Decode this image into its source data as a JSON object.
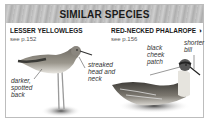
{
  "panel": {
    "title": "SIMILAR SPECIES",
    "species": [
      {
        "name": "LESSER YELLOWLEGS",
        "ref": "see p.152",
        "annotations": [
          {
            "line1": "darker,",
            "line2": "spotted",
            "line3": "back"
          },
          {
            "line1": "streaked",
            "line2": "head and",
            "line3": "neck"
          }
        ]
      },
      {
        "name": "RED-NECKED PHALAROPE",
        "ref": "see p.156",
        "symbol": "◑",
        "annotations": [
          {
            "line1": "black",
            "line2": "cheek",
            "line3": "patch"
          },
          {
            "line1": "shorter",
            "line2": "bill"
          }
        ]
      }
    ]
  }
}
